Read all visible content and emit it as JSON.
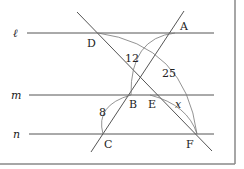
{
  "figure": {
    "parallel_lines": [
      {
        "name": "l",
        "label": "ℓ"
      },
      {
        "name": "m",
        "label": "m"
      },
      {
        "name": "n",
        "label": "n"
      }
    ],
    "points": {
      "A": "A",
      "B": "B",
      "C": "C",
      "D": "D",
      "E": "E",
      "F": "F"
    },
    "measures": {
      "AB": "12",
      "DF": "25",
      "BC": "8",
      "EF": "x"
    },
    "colors": {
      "line": "#555555",
      "arc": "#777777",
      "frame": "#888888",
      "text": "#222222"
    }
  }
}
